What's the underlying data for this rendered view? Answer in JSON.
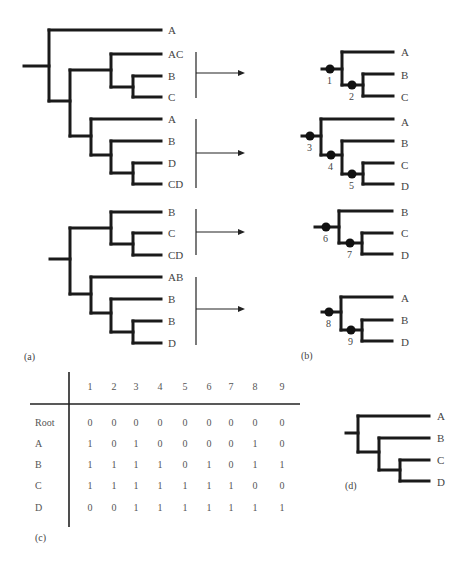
{
  "panels": {
    "a": {
      "label": "(a)",
      "gene_trees": [
        {
          "leaves": [
            "A",
            "AC",
            "B",
            "C",
            "A",
            "B",
            "D",
            "CD"
          ]
        },
        {
          "leaves": [
            "B",
            "C",
            "CD",
            "AB",
            "B",
            "B",
            "D"
          ]
        }
      ]
    },
    "b": {
      "label": "(b)",
      "subtrees": [
        {
          "leaves": [
            "A",
            "B",
            "C"
          ],
          "nodes": [
            "1",
            "2"
          ]
        },
        {
          "leaves": [
            "A",
            "B",
            "C",
            "D"
          ],
          "nodes": [
            "3",
            "4",
            "5"
          ]
        },
        {
          "leaves": [
            "B",
            "C",
            "D"
          ],
          "nodes": [
            "6",
            "7"
          ]
        },
        {
          "leaves": [
            "A",
            "B",
            "D"
          ],
          "nodes": [
            "8",
            "9"
          ]
        }
      ]
    },
    "c": {
      "label": "(c)",
      "columns": [
        "1",
        "2",
        "3",
        "4",
        "5",
        "6",
        "7",
        "8",
        "9"
      ],
      "rows": [
        {
          "name": "Root",
          "values": [
            "0",
            "0",
            "0",
            "0",
            "0",
            "0",
            "0",
            "0",
            "0"
          ]
        },
        {
          "name": "A",
          "values": [
            "1",
            "0",
            "1",
            "0",
            "0",
            "0",
            "0",
            "1",
            "0"
          ]
        },
        {
          "name": "B",
          "values": [
            "1",
            "1",
            "1",
            "1",
            "0",
            "1",
            "0",
            "1",
            "1"
          ]
        },
        {
          "name": "C",
          "values": [
            "1",
            "1",
            "1",
            "1",
            "1",
            "1",
            "1",
            "0",
            "0"
          ]
        },
        {
          "name": "D",
          "values": [
            "0",
            "0",
            "1",
            "1",
            "1",
            "1",
            "1",
            "1",
            "1"
          ]
        }
      ]
    },
    "d": {
      "label": "(d)",
      "leaves": [
        "A",
        "B",
        "C",
        "D"
      ]
    }
  }
}
